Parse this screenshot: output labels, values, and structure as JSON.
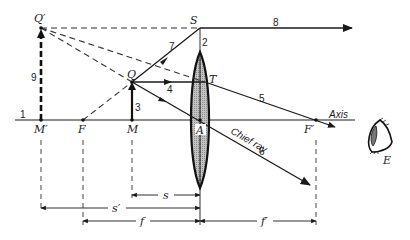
{
  "figure": {
    "type": "thin converging lens virtual image (magnifier) ray diagram",
    "axis_label": "Axis",
    "points": {
      "Q_prime": "Q′",
      "S": "S",
      "Q": "Q",
      "T": "T",
      "M_prime": "M′",
      "F": "F",
      "M": "M",
      "A": "A",
      "F_prime": "F′",
      "E": "E"
    },
    "ray_numbers": {
      "n1": "1",
      "n2": "2",
      "n3": "3",
      "n4": "4",
      "n5": "5",
      "n6": "6",
      "n7": "7",
      "n8": "8",
      "n9": "9"
    },
    "chief_ray_label": "Chief ray",
    "dimensions": {
      "s": "s",
      "s_prime": "s′",
      "f": "f",
      "f_prime": "f′"
    },
    "colors": {
      "ink": "#1a1a1a",
      "lens_fill": "#b8b8b8",
      "background": "#ffffff"
    }
  }
}
